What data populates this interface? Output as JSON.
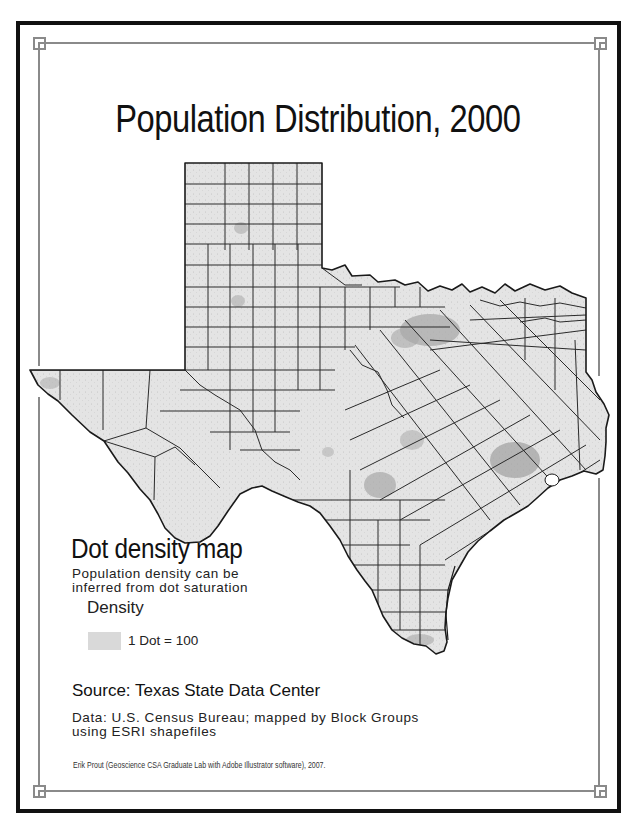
{
  "title": "Population Distribution, 2000",
  "legend": {
    "heading": "Dot density map",
    "description_line1": "Population density can be",
    "description_line2": "inferred from dot saturation",
    "density_label": "Density",
    "swatch_label": "1 Dot = 100",
    "swatch_color": "#d9d9d9"
  },
  "source": {
    "title": "Source: Texas State Data Center",
    "data_line1": "Data: U.S. Census Bureau; mapped by Block Groups",
    "data_line2": "using ESRI shapefiles",
    "credit": "Erik Prout (Geoscience CSA Graduate Lab with Adobe Illustrator software), 2007."
  },
  "map": {
    "region": "Texas",
    "fill_color": "#e2e2e2",
    "border_color": "#222222",
    "dense_areas": [
      "Dallas-Fort Worth",
      "Houston",
      "San Antonio",
      "Austin",
      "El Paso",
      "Rio Grande Valley"
    ]
  },
  "colors": {
    "outer_frame": "#111111",
    "inner_frame": "#8a8a8a",
    "background": "#ffffff"
  }
}
